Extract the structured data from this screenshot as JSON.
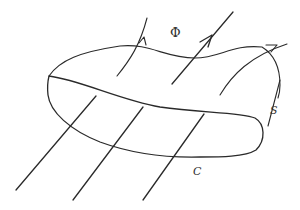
{
  "diagram": {
    "type": "magnetic-flux-through-surface",
    "labels": {
      "flux": "Φ",
      "surface": "S",
      "curve": "C"
    },
    "colors": {
      "stroke": "#2a2a2a",
      "background": "#ffffff"
    },
    "elements": {
      "field_lines_count": 6,
      "arrows_count": 3
    }
  }
}
